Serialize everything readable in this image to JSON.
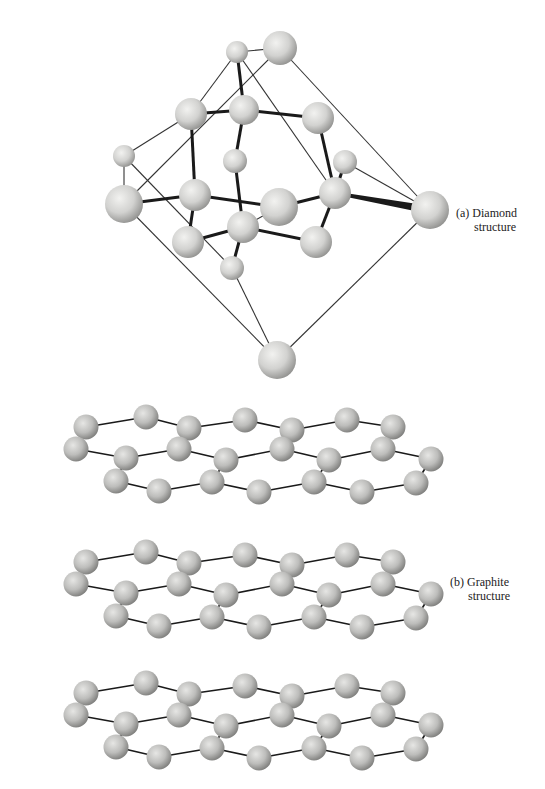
{
  "figure": {
    "diamond": {
      "label_line1": "(a) Diamond",
      "label_line2": "structure",
      "atoms": [
        {
          "id": "a1",
          "x": 237,
          "y": 52,
          "r": 11
        },
        {
          "id": "a2",
          "x": 280,
          "y": 48,
          "r": 17
        },
        {
          "id": "a3",
          "x": 191,
          "y": 114,
          "r": 16
        },
        {
          "id": "a4",
          "x": 244,
          "y": 110,
          "r": 15
        },
        {
          "id": "a5",
          "x": 318,
          "y": 118,
          "r": 16
        },
        {
          "id": "a6",
          "x": 124,
          "y": 156,
          "r": 11
        },
        {
          "id": "a7",
          "x": 235,
          "y": 161,
          "r": 12
        },
        {
          "id": "a8",
          "x": 345,
          "y": 162,
          "r": 12
        },
        {
          "id": "a9",
          "x": 124,
          "y": 204,
          "r": 19
        },
        {
          "id": "a10",
          "x": 195,
          "y": 195,
          "r": 16
        },
        {
          "id": "a11",
          "x": 279,
          "y": 207,
          "r": 19
        },
        {
          "id": "a12",
          "x": 335,
          "y": 193,
          "r": 16
        },
        {
          "id": "a13",
          "x": 430,
          "y": 210,
          "r": 19
        },
        {
          "id": "a14",
          "x": 188,
          "y": 242,
          "r": 16
        },
        {
          "id": "a15",
          "x": 243,
          "y": 227,
          "r": 16
        },
        {
          "id": "a16",
          "x": 316,
          "y": 242,
          "r": 16
        },
        {
          "id": "a17",
          "x": 232,
          "y": 268,
          "r": 12
        },
        {
          "id": "a18",
          "x": 277,
          "y": 360,
          "r": 19
        }
      ],
      "thin_edges": [
        [
          "a1",
          "a2"
        ],
        [
          "a1",
          "a3"
        ],
        [
          "a3",
          "a6"
        ],
        [
          "a6",
          "a9"
        ],
        [
          "a2",
          "a9"
        ],
        [
          "a1",
          "a12"
        ],
        [
          "a2",
          "a13"
        ],
        [
          "a8",
          "a13"
        ],
        [
          "a9",
          "a18"
        ],
        [
          "a6",
          "a17"
        ],
        [
          "a17",
          "a18"
        ],
        [
          "a13",
          "a18"
        ],
        [
          "a11",
          "a15"
        ],
        [
          "a15",
          "a17"
        ]
      ],
      "thick_edges": [
        [
          "a1",
          "a4"
        ],
        [
          "a4",
          "a7"
        ],
        [
          "a4",
          "a5"
        ],
        [
          "a3",
          "a4"
        ],
        [
          "a3",
          "a10"
        ],
        [
          "a7",
          "a15"
        ],
        [
          "a5",
          "a12"
        ],
        [
          "a9",
          "a10"
        ],
        [
          "a10",
          "a11"
        ],
        [
          "a10",
          "a14"
        ],
        [
          "a14",
          "a15"
        ],
        [
          "a15",
          "a16"
        ],
        [
          "a15",
          "a17"
        ],
        [
          "a11",
          "a12"
        ],
        [
          "a12",
          "a16"
        ],
        [
          "a12",
          "a8"
        ]
      ],
      "taper_edges": [
        [
          "a12",
          "a13"
        ]
      ]
    },
    "graphite": {
      "label_line1": "(b) Graphite",
      "label_line2": "structure",
      "layer_offsets_y": [
        0,
        135,
        266
      ],
      "layer_base": {
        "atoms": [
          {
            "id": "b1",
            "x": 86,
            "y": 427
          },
          {
            "id": "b2",
            "x": 146,
            "y": 417
          },
          {
            "id": "b3",
            "x": 189,
            "y": 428
          },
          {
            "id": "b4",
            "x": 245,
            "y": 420
          },
          {
            "id": "b5",
            "x": 292,
            "y": 430
          },
          {
            "id": "b6",
            "x": 347,
            "y": 420
          },
          {
            "id": "b7",
            "x": 393,
            "y": 427
          },
          {
            "id": "c1",
            "x": 76,
            "y": 449
          },
          {
            "id": "c2",
            "x": 126,
            "y": 458
          },
          {
            "id": "c3",
            "x": 179,
            "y": 449
          },
          {
            "id": "c4",
            "x": 226,
            "y": 460
          },
          {
            "id": "c5",
            "x": 282,
            "y": 449
          },
          {
            "id": "c6",
            "x": 329,
            "y": 460
          },
          {
            "id": "c7",
            "x": 383,
            "y": 449
          },
          {
            "id": "c8",
            "x": 431,
            "y": 459
          },
          {
            "id": "d1",
            "x": 116,
            "y": 481
          },
          {
            "id": "d2",
            "x": 159,
            "y": 491
          },
          {
            "id": "d3",
            "x": 212,
            "y": 482
          },
          {
            "id": "d4",
            "x": 259,
            "y": 492
          },
          {
            "id": "d5",
            "x": 314,
            "y": 482
          },
          {
            "id": "d6",
            "x": 362,
            "y": 492
          },
          {
            "id": "d7",
            "x": 416,
            "y": 483
          }
        ],
        "r": 12.5,
        "edges": [
          [
            "b1",
            "b2"
          ],
          [
            "b2",
            "b3"
          ],
          [
            "b3",
            "b4"
          ],
          [
            "b4",
            "b5"
          ],
          [
            "b5",
            "b6"
          ],
          [
            "b6",
            "b7"
          ],
          [
            "b1",
            "c1"
          ],
          [
            "c1",
            "c2"
          ],
          [
            "c2",
            "c3"
          ],
          [
            "c3",
            "b3"
          ],
          [
            "c3",
            "c4"
          ],
          [
            "c4",
            "c5"
          ],
          [
            "c5",
            "b5"
          ],
          [
            "c5",
            "c6"
          ],
          [
            "c6",
            "c7"
          ],
          [
            "c7",
            "b7"
          ],
          [
            "c7",
            "c8"
          ],
          [
            "c2",
            "d1"
          ],
          [
            "d1",
            "d2"
          ],
          [
            "d2",
            "d3"
          ],
          [
            "d3",
            "c4"
          ],
          [
            "d3",
            "d4"
          ],
          [
            "d4",
            "d5"
          ],
          [
            "d5",
            "c6"
          ],
          [
            "d5",
            "d6"
          ],
          [
            "d6",
            "d7"
          ],
          [
            "d7",
            "c8"
          ]
        ]
      }
    }
  }
}
